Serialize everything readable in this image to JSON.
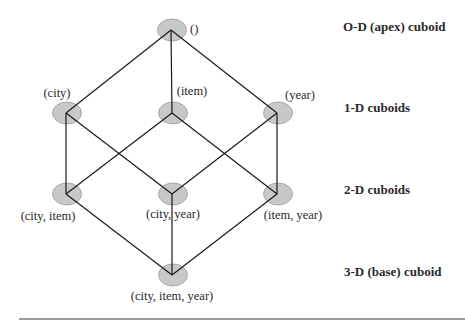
{
  "diagram": {
    "type": "lattice",
    "levels": [
      {
        "label": "O-D (apex) cuboid",
        "y": 30
      },
      {
        "label": "1-D cuboids",
        "y": 113
      },
      {
        "label": "2-D cuboids",
        "y": 194
      },
      {
        "label": "3-D  (base) cuboid",
        "y": 275
      }
    ],
    "nodes": [
      {
        "id": "apex",
        "label": "()",
        "x": 171,
        "y": 30,
        "lx": 190,
        "ly": 33,
        "anchor": "start"
      },
      {
        "id": "city",
        "label": "(city)",
        "x": 66,
        "y": 113,
        "lx": 57,
        "ly": 97,
        "anchor": "middle"
      },
      {
        "id": "item",
        "label": "(item)",
        "x": 172,
        "y": 113,
        "lx": 192,
        "ly": 95,
        "anchor": "middle"
      },
      {
        "id": "year",
        "label": "(year)",
        "x": 277,
        "y": 113,
        "lx": 300,
        "ly": 99,
        "anchor": "middle"
      },
      {
        "id": "city_item",
        "label": "(city, item)",
        "x": 66,
        "y": 194,
        "lx": 48,
        "ly": 220,
        "anchor": "middle"
      },
      {
        "id": "city_year",
        "label": "(city, year)",
        "x": 172,
        "y": 194,
        "lx": 173,
        "ly": 218,
        "anchor": "middle"
      },
      {
        "id": "item_year",
        "label": "(item, year)",
        "x": 277,
        "y": 194,
        "lx": 293,
        "ly": 219,
        "anchor": "middle"
      },
      {
        "id": "base",
        "label": "(city, item, year)",
        "x": 172,
        "y": 275,
        "lx": 172,
        "ly": 300,
        "anchor": "middle"
      }
    ],
    "edges": [
      [
        "apex",
        "city"
      ],
      [
        "apex",
        "item"
      ],
      [
        "apex",
        "year"
      ],
      [
        "city",
        "city_item"
      ],
      [
        "city",
        "city_year"
      ],
      [
        "item",
        "city_item"
      ],
      [
        "item",
        "item_year"
      ],
      [
        "year",
        "city_year"
      ],
      [
        "year",
        "item_year"
      ],
      [
        "city_item",
        "base"
      ],
      [
        "city_year",
        "base"
      ],
      [
        "item_year",
        "base"
      ]
    ],
    "colors": {
      "node_fill": "#c8c8c8",
      "node_stroke": "#9a9a9a",
      "edge": "#1a1a1a",
      "text": "#2a2a2a",
      "rule": "#7a7a7a"
    }
  }
}
